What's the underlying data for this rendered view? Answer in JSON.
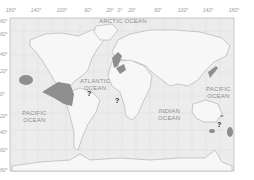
{
  "map": {
    "title": "World map",
    "colors": {
      "ocean": "#ececec",
      "land": "#f7f7f7",
      "outline": "#b5b5b5",
      "shaded": "#8e8e8e",
      "grid": "#d9d9d9",
      "frame": "#bdbdbd"
    },
    "longitude_labels": [
      "180°",
      "140°",
      "100°",
      "60°",
      "20°",
      "0°",
      "20°",
      "60°",
      "100°",
      "140°",
      "180°"
    ],
    "latitude_labels": [
      "80°",
      "60°",
      "40°",
      "20°",
      "0°",
      "20°",
      "40°",
      "60°",
      "80°"
    ],
    "oceans": [
      {
        "name": "arctic",
        "line1": "ARCTIC OCEAN",
        "line2": ""
      },
      {
        "name": "atlantic",
        "line1": "ATLANTIC",
        "line2": "OCEAN"
      },
      {
        "name": "pacific-west",
        "line1": "PACIFIC",
        "line2": "OCEAN"
      },
      {
        "name": "indian",
        "line1": "INDIAN",
        "line2": "OCEAN"
      },
      {
        "name": "pacific-east",
        "line1": "PACIFIC",
        "line2": "OCEAN"
      }
    ],
    "markers": [
      {
        "label": "?"
      },
      {
        "label": "?"
      },
      {
        "label": "?"
      }
    ]
  }
}
